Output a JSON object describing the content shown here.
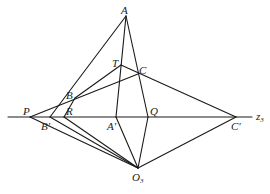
{
  "diagram": {
    "type": "geometric-construction",
    "axis_label": "z",
    "axis_label_sub": "3",
    "points": {
      "A": {
        "label": "A",
        "x": 126,
        "y": 16
      },
      "T": {
        "label": "T",
        "x": 121,
        "y": 65
      },
      "C": {
        "label": "C",
        "x": 138,
        "y": 74
      },
      "B": {
        "label": "B",
        "x": 75,
        "y": 98
      },
      "P": {
        "label": "P",
        "x": 30,
        "y": 117
      },
      "Bp": {
        "label": "B'",
        "x": 50,
        "y": 117
      },
      "R": {
        "label": "R",
        "x": 64,
        "y": 117
      },
      "Ap": {
        "label": "A'",
        "x": 116,
        "y": 117
      },
      "Q": {
        "label": "Q",
        "x": 148,
        "y": 117
      },
      "Cp": {
        "label": "C'",
        "x": 236,
        "y": 117
      },
      "O3": {
        "label": "O",
        "sub": "3",
        "x": 138,
        "y": 168
      }
    },
    "segments": [
      [
        "A",
        "Bp"
      ],
      [
        "A",
        "Ap"
      ],
      [
        "A",
        "Q"
      ],
      [
        "T",
        "Cp"
      ],
      [
        "T",
        "B"
      ],
      [
        "C",
        "P"
      ],
      [
        "B",
        "R"
      ],
      [
        "P",
        "O3"
      ],
      [
        "Bp",
        "O3"
      ],
      [
        "R",
        "O3"
      ],
      [
        "Ap",
        "O3"
      ],
      [
        "Q",
        "O3"
      ],
      [
        "Cp",
        "O3"
      ]
    ]
  }
}
